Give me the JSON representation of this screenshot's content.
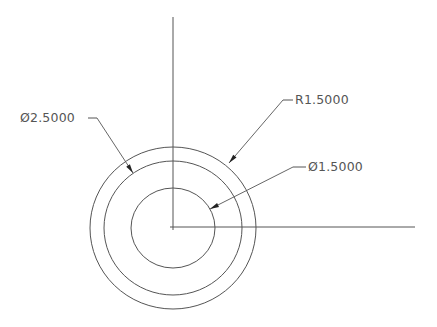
{
  "drawing": {
    "colors": {
      "background": "#ffffff",
      "line": "#555555",
      "text": "#555555"
    },
    "center": {
      "x": 173,
      "y": 228
    },
    "centerlines": {
      "vertical": {
        "x": 173,
        "y1": 17,
        "y2": 230
      },
      "horizontal": {
        "y": 227,
        "x1": 170,
        "x2": 415
      }
    },
    "circles": [
      {
        "name": "outer-circle",
        "rx": 83,
        "ry": 81
      },
      {
        "name": "middle-circle",
        "rx": 69,
        "ry": 67
      },
      {
        "name": "inner-circle",
        "rx": 42,
        "ry": 40
      }
    ],
    "dimensions": [
      {
        "name": "diameter-outer",
        "label": "Ø2.5000",
        "text_x": 20,
        "text_y": 122,
        "tick": {
          "x1": 88,
          "y1": 118,
          "x2": 97,
          "y2": 118
        },
        "leader": {
          "x1": 97,
          "y1": 118,
          "x2": 133,
          "y2": 173
        }
      },
      {
        "name": "radius-middle",
        "label": "R1.5000",
        "text_x": 295,
        "text_y": 104,
        "tick": {
          "x1": 283,
          "y1": 100,
          "x2": 293,
          "y2": 100
        },
        "leader": {
          "x1": 283,
          "y1": 100,
          "x2": 229,
          "y2": 163
        }
      },
      {
        "name": "diameter-inner",
        "label": "Ø1.5000",
        "text_x": 308,
        "text_y": 171,
        "tick": {
          "x1": 293,
          "y1": 167,
          "x2": 306,
          "y2": 167
        },
        "leader": {
          "x1": 293,
          "y1": 167,
          "x2": 210,
          "y2": 209
        }
      }
    ]
  }
}
